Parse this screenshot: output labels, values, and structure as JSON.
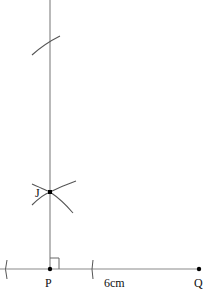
{
  "diagram": {
    "type": "geometric-construction",
    "points": [
      {
        "id": "P",
        "label": "P"
      },
      {
        "id": "J",
        "label": "J"
      },
      {
        "id": "Q",
        "label": "Q"
      }
    ],
    "measurements": [
      {
        "segment": "PQ",
        "label": "6cm"
      }
    ],
    "annotations": [
      "right-angle-marker-at-P",
      "construction-arcs"
    ],
    "colors": {
      "line": "#8a8a8a",
      "arc": "#555555",
      "point": "#000000",
      "text": "#111111"
    }
  }
}
